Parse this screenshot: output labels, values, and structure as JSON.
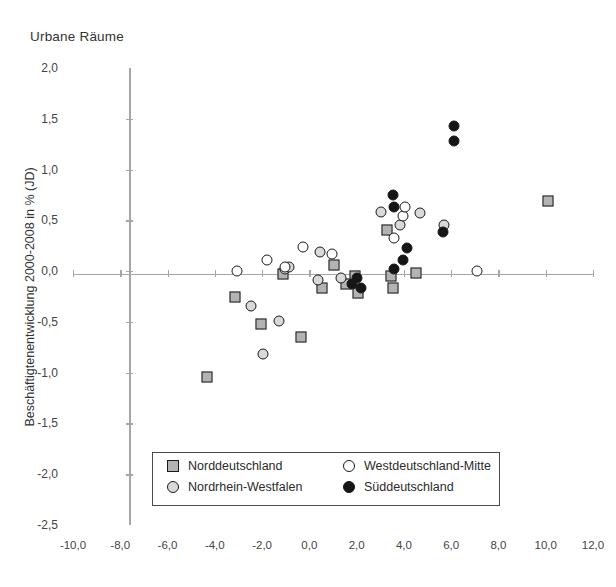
{
  "chart_data": {
    "type": "scatter",
    "title": "Urbane Räume",
    "xlabel": "",
    "ylabel": "Beschäftigtenentwicklung 2000-2008 in % (JD)",
    "xlim": [
      -10.0,
      12.0
    ],
    "ylim": [
      -2.5,
      2.0
    ],
    "xticks": [
      "-10,0",
      "-8,0",
      "-6,0",
      "-4,0",
      "-2,0",
      "0,0",
      "2,0",
      "4,0",
      "6,0",
      "8,0",
      "10,0",
      "12,0"
    ],
    "xtick_values": [
      -10.0,
      -8.0,
      -6.0,
      -4.0,
      -2.0,
      0.0,
      2.0,
      4.0,
      6.0,
      8.0,
      10.0,
      12.0
    ],
    "yticks": [
      "2,0",
      "1,5",
      "1,0",
      "0,5",
      "0,0",
      "-0,5",
      "-1,0",
      "-1,5",
      "-2,0",
      "-2,5"
    ],
    "ytick_values": [
      2.0,
      1.5,
      1.0,
      0.5,
      0.0,
      -0.5,
      -1.0,
      -1.5,
      -2.0,
      -2.5
    ],
    "grid": false,
    "legend_position": "bottom-center",
    "series": [
      {
        "name": "Norddeutschland",
        "marker": "square",
        "color": "#b3b3b3",
        "edge_color": "#1a1a1a",
        "points": [
          [
            -4.35,
            -1.04
          ],
          [
            -3.15,
            -0.25
          ],
          [
            -2.05,
            -0.52
          ],
          [
            -0.35,
            -0.65
          ],
          [
            -1.1,
            -0.03
          ],
          [
            0.55,
            -0.17
          ],
          [
            1.05,
            0.06
          ],
          [
            1.55,
            -0.13
          ],
          [
            1.95,
            -0.05
          ],
          [
            2.05,
            -0.22
          ],
          [
            3.45,
            -0.05
          ],
          [
            3.55,
            -0.17
          ],
          [
            3.3,
            0.4
          ],
          [
            4.5,
            -0.02
          ],
          [
            10.1,
            0.69
          ]
        ]
      },
      {
        "name": "Nordrhein-Westfalen",
        "marker": "circle",
        "color": "#d9d9d9",
        "edge_color": "#1a1a1a",
        "points": [
          [
            -2.45,
            -0.34
          ],
          [
            -1.95,
            -0.82
          ],
          [
            -1.3,
            -0.49
          ],
          [
            -1.05,
            0.02
          ],
          [
            -0.85,
            0.04
          ],
          [
            0.35,
            -0.09
          ],
          [
            1.35,
            -0.07
          ],
          [
            3.05,
            0.58
          ],
          [
            3.85,
            0.45
          ],
          [
            4.7,
            0.57
          ],
          [
            5.7,
            0.45
          ],
          [
            0.45,
            0.19
          ]
        ]
      },
      {
        "name": "Westdeutschland-Mitte",
        "marker": "circle",
        "color": "#ffffff",
        "edge_color": "#1a1a1a",
        "points": [
          [
            -3.05,
            0.0
          ],
          [
            -1.8,
            0.11
          ],
          [
            -1.05,
            0.04
          ],
          [
            -0.25,
            0.24
          ],
          [
            0.95,
            0.17
          ],
          [
            3.6,
            0.33
          ],
          [
            3.95,
            0.54
          ],
          [
            4.05,
            0.63
          ],
          [
            7.1,
            0.0
          ]
        ]
      },
      {
        "name": "Süddeutschland",
        "marker": "circle",
        "color": "#161616",
        "edge_color": "#161616",
        "points": [
          [
            6.1,
            1.43
          ],
          [
            6.1,
            1.28
          ],
          [
            3.55,
            0.75
          ],
          [
            3.6,
            0.63
          ],
          [
            4.15,
            0.23
          ],
          [
            3.95,
            0.11
          ],
          [
            3.6,
            0.02
          ],
          [
            5.65,
            0.39
          ],
          [
            1.8,
            -0.13
          ],
          [
            2.2,
            -0.17
          ],
          [
            2.0,
            -0.07
          ]
        ]
      }
    ]
  },
  "legend": {
    "items": [
      {
        "label": "Norddeutschland",
        "marker": "square",
        "fill": "#b3b3b3"
      },
      {
        "label": "Nordrhein-Westfalen",
        "marker": "circle",
        "fill": "#d9d9d9"
      },
      {
        "label": "Westdeutschland-Mitte",
        "marker": "circle",
        "fill": "#ffffff"
      },
      {
        "label": "Süddeutschland",
        "marker": "circle",
        "fill": "#161616"
      }
    ]
  }
}
